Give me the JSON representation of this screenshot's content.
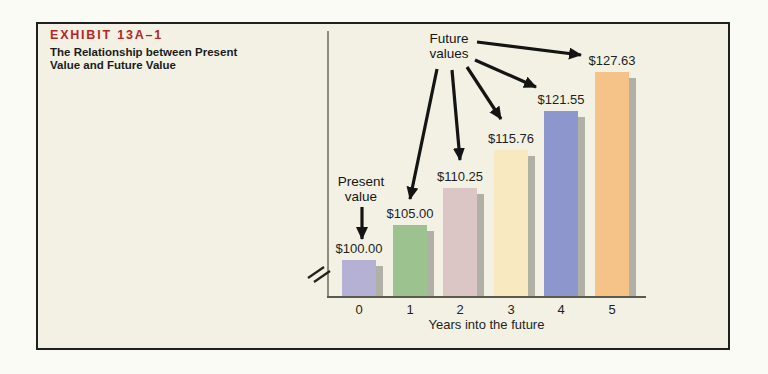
{
  "exhibit": {
    "label": "EXHIBIT 13A–1",
    "label_color": "#b5262b",
    "subtitle_line1": "The Relationship between Present",
    "subtitle_line2": "Value and Future Value"
  },
  "chart_data": {
    "type": "bar",
    "categories": [
      "0",
      "1",
      "2",
      "3",
      "4",
      "5"
    ],
    "values": [
      100.0,
      105.0,
      110.25,
      115.76,
      121.55,
      127.63
    ],
    "value_labels": [
      "$100.00",
      "$105.00",
      "$110.25",
      "$115.76",
      "$121.55",
      "$127.63"
    ],
    "xlabel": "Years into the future",
    "ylabel": "",
    "grid": false,
    "legend": false,
    "y_axis_break": true,
    "bar_colors": [
      "#b4b1d5",
      "#9cc38f",
      "#dcc5c5",
      "#f8e9c0",
      "#8e97cd",
      "#f5c287"
    ],
    "shadow_color": "#a6a59c",
    "bar_heights_px": [
      36,
      71,
      108,
      146,
      185,
      224
    ],
    "annotations": {
      "present_value": {
        "line1": "Present",
        "line2": "value"
      },
      "future_values": {
        "line1": "Future",
        "line2": "values"
      }
    }
  }
}
